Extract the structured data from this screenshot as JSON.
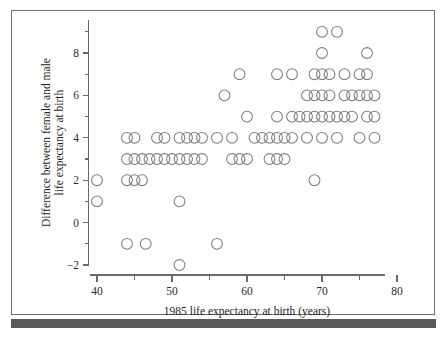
{
  "figure": {
    "background_color": "#ffffff",
    "frame_color": "#6f6f6f",
    "bottom_bar_color": "#59595b",
    "marker_stroke_color": "#7d7d7d",
    "axis_color": "#6a6a6a"
  },
  "chart_data": {
    "type": "scatter",
    "title": "",
    "xlabel": "1985 life expectancy at birth (years)",
    "ylabel": "Difference between female and male life expectancy at birth",
    "xlim": [
      39,
      79
    ],
    "ylim": [
      -2.6,
      9.6
    ],
    "grid": false,
    "legend": null,
    "xticks": [
      40,
      50,
      60,
      70,
      80
    ],
    "xtick_labels": [
      "40",
      "50",
      "60",
      "70",
      "80"
    ],
    "xminorticks": [
      45,
      55,
      65,
      75
    ],
    "yticks": [
      -2,
      0,
      2,
      4,
      6,
      8
    ],
    "ytick_labels": [
      "−2",
      "0",
      "2",
      "4",
      "6",
      "8"
    ],
    "yminorticks": [
      -1,
      1,
      3,
      5,
      7,
      9
    ],
    "marker": "open-circle",
    "marker_size": 5.4,
    "points": [
      [
        40,
        2
      ],
      [
        40,
        1
      ],
      [
        44,
        4
      ],
      [
        45,
        4
      ],
      [
        44,
        3
      ],
      [
        45,
        3
      ],
      [
        46,
        3
      ],
      [
        47,
        3
      ],
      [
        48,
        3
      ],
      [
        49,
        3
      ],
      [
        50,
        3
      ],
      [
        51,
        3
      ],
      [
        52,
        3
      ],
      [
        53,
        3
      ],
      [
        54,
        3
      ],
      [
        44,
        2
      ],
      [
        45,
        2
      ],
      [
        46,
        2
      ],
      [
        44,
        -1
      ],
      [
        46.5,
        -1
      ],
      [
        48,
        4
      ],
      [
        49,
        4
      ],
      [
        51,
        1
      ],
      [
        51,
        -2
      ],
      [
        51,
        4
      ],
      [
        52,
        4
      ],
      [
        53,
        4
      ],
      [
        54,
        4
      ],
      [
        56,
        4
      ],
      [
        56,
        -1
      ],
      [
        57,
        6
      ],
      [
        58,
        4
      ],
      [
        58,
        3
      ],
      [
        59,
        3
      ],
      [
        60,
        3
      ],
      [
        59,
        7
      ],
      [
        60,
        5
      ],
      [
        61,
        4
      ],
      [
        62,
        4
      ],
      [
        63,
        4
      ],
      [
        64,
        4
      ],
      [
        65,
        4
      ],
      [
        63,
        3
      ],
      [
        64,
        3
      ],
      [
        65,
        3
      ],
      [
        64,
        7
      ],
      [
        66,
        7
      ],
      [
        64,
        5
      ],
      [
        66,
        5
      ],
      [
        67,
        5
      ],
      [
        68,
        5
      ],
      [
        66,
        4
      ],
      [
        68,
        6
      ],
      [
        69,
        6
      ],
      [
        70,
        6
      ],
      [
        71,
        6
      ],
      [
        69,
        7
      ],
      [
        70,
        7
      ],
      [
        71,
        7
      ],
      [
        70,
        9
      ],
      [
        72,
        9
      ],
      [
        70,
        8
      ],
      [
        68,
        4
      ],
      [
        70,
        4
      ],
      [
        72,
        4
      ],
      [
        69,
        2
      ],
      [
        69,
        5
      ],
      [
        70,
        5
      ],
      [
        71,
        5
      ],
      [
        72,
        5
      ],
      [
        73,
        5
      ],
      [
        74,
        5
      ],
      [
        73,
        6
      ],
      [
        74,
        6
      ],
      [
        75,
        6
      ],
      [
        76,
        6
      ],
      [
        77,
        6
      ],
      [
        73,
        7
      ],
      [
        75,
        7
      ],
      [
        76,
        7
      ],
      [
        76,
        8
      ],
      [
        76,
        5
      ],
      [
        77,
        5
      ],
      [
        75,
        4
      ],
      [
        77,
        4
      ]
    ]
  },
  "labels": {
    "x_axis_title": "1985 life expectancy at birth (years)",
    "y_axis_title_line1": "Difference between female and male",
    "y_axis_title_line2": "life expectancy at birth"
  }
}
